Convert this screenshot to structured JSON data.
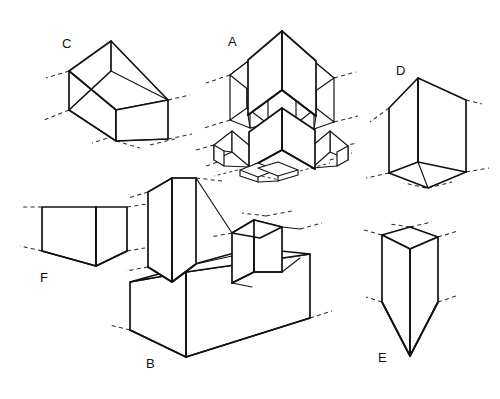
{
  "page": {
    "background_color": "#ffffff",
    "line_color": "#111111",
    "dash_color": "#2b2b2b",
    "width": 500,
    "height": 399
  },
  "figures": [
    {
      "id": "C",
      "label": "C",
      "name": "elongated-rectangular-prism",
      "description": "Long horizontal rectangular block drawn in two-point perspective with dashed ground/axis extension lines at the corners",
      "label_x": 62,
      "label_y": 48
    },
    {
      "id": "A",
      "label": "A",
      "name": "four-quadrant-stacked-block-assembly",
      "description": "Complex assembly of four tall upright blocks arranged around a central axis in two tiers, with dashed axis extensions",
      "label_x": 228,
      "label_y": 46
    },
    {
      "id": "D",
      "label": "D",
      "name": "tilted-cube",
      "description": "Single cube seen from below-front with a slanted top face and dashed edge extensions",
      "label_x": 396,
      "label_y": 75
    },
    {
      "id": "F",
      "label": "F",
      "name": "low-wide-rectangular-block",
      "description": "Short wide rectangular block viewed from slightly above with dashed extension lines at the left and right",
      "label_x": 40,
      "label_y": 282
    },
    {
      "id": "B",
      "label": "B",
      "name": "stepped-composite-solid",
      "description": "Large stepped solid: a wide low base with a tall upright block on the left and a small cube on the right upper surface",
      "label_x": 146,
      "label_y": 368
    },
    {
      "id": "E",
      "label": "E",
      "name": "tapered-wedge-prism",
      "description": "Upright prism with a square top that tapers to a point at the bottom, with dashed extensions at the top and mid-sides",
      "label_x": 378,
      "label_y": 362
    }
  ],
  "icons": {
    "dashed_extension": "dashed-axis-line",
    "solid_edge": "solid-edge-line"
  }
}
